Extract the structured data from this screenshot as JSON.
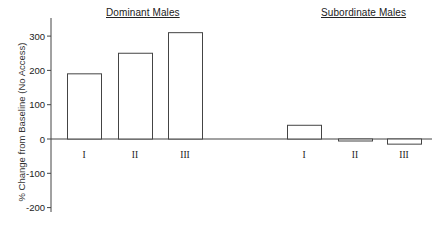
{
  "chart_data": {
    "type": "bar",
    "title": "",
    "xlabel": "",
    "ylabel": "% Change from Baseline (No Access)",
    "ylim": [
      -200,
      330
    ],
    "yticks": [
      300,
      200,
      100,
      0,
      -100,
      -200
    ],
    "grid": false,
    "legend": null,
    "groups": [
      {
        "name": "Dominant Males",
        "categories": [
          "I",
          "II",
          "III"
        ],
        "values": [
          190,
          250,
          310
        ]
      },
      {
        "name": "Subordinate Males",
        "categories": [
          "I",
          "II",
          "III"
        ],
        "values": [
          40,
          -5,
          -15
        ]
      }
    ]
  },
  "labels": {
    "group_dominant": "Dominant Males",
    "group_subordinate": "Subordinate Males",
    "ylabel": "% Change from Baseline (No Access)"
  },
  "colors": {
    "bar_fill": "#ffffff",
    "bar_stroke": "#444444",
    "axis": "#444444",
    "text": "#222222"
  }
}
